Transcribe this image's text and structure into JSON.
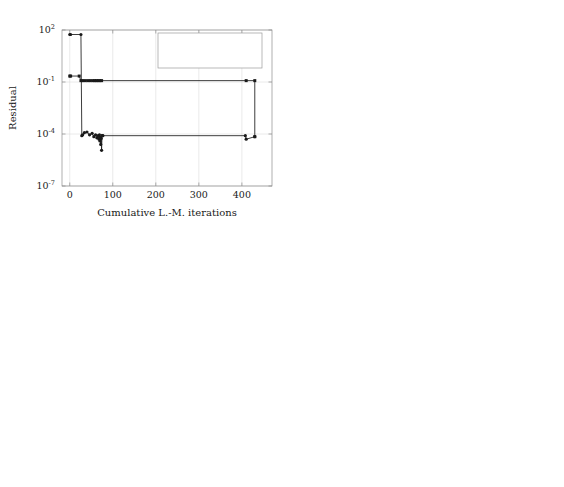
{
  "figure": {
    "layout": "2x2 grid of semilog-y convergence plots",
    "legend": {
      "position": "top-right of first panel",
      "entries": [
        {
          "label": "Feasibility",
          "marker": "dot",
          "color": "#1a1a1a"
        },
        {
          "label": "Opt. cond.",
          "marker": "square",
          "color": "#1a1a1a"
        }
      ]
    },
    "common": {
      "xlabel": "Cumulative L.-M. iterations",
      "ylabel": "Residual",
      "ytick_labels": [
        "10",
        "10",
        "10",
        "10"
      ],
      "ytick_exponents": [
        "2",
        "-1",
        "-4",
        "-7"
      ],
      "ylim": [
        1e-07,
        100
      ],
      "grid": true
    }
  },
  "chart_data": [
    {
      "type": "line",
      "panel": "top-left",
      "title": "",
      "xlabel": "Cumulative L.-M. iterations",
      "ylabel": "Residual",
      "yscale": "log",
      "ylim": [
        1e-07,
        100
      ],
      "xlim": [
        -18,
        470
      ],
      "xticks": [
        0,
        100,
        200,
        300,
        400
      ],
      "xtick_labels": [
        "0",
        "100",
        "200",
        "300",
        "400"
      ],
      "yticks": [
        100,
        0.1,
        0.0001,
        1e-07
      ],
      "series": [
        {
          "name": "Feasibility",
          "x": [
            0,
            2,
            26,
            28,
            30,
            34,
            40,
            46,
            52,
            56,
            60,
            63,
            66,
            68,
            69,
            70,
            71,
            72,
            73,
            74,
            75,
            76,
            77,
            408,
            410,
            430
          ],
          "y": [
            55,
            55,
            55,
            8e-05,
            9e-05,
            0.00012,
            0.00013,
            9e-05,
            0.00011,
            7e-05,
            9e-05,
            6e-05,
            8e-05,
            5e-05,
            9e-05,
            4e-05,
            6.5e-05,
            2.5e-05,
            5.5e-05,
            1.15e-05,
            8e-05,
            8e-05,
            8e-05,
            8e-05,
            5e-05,
            7e-05
          ]
        },
        {
          "name": "Opt. cond.",
          "x": [
            0,
            2,
            22,
            26,
            30,
            36,
            42,
            48,
            54,
            58,
            62,
            66,
            70,
            74,
            410,
            430,
            430
          ],
          "y": [
            0.22,
            0.22,
            0.22,
            0.12,
            0.12,
            0.12,
            0.12,
            0.12,
            0.12,
            0.12,
            0.12,
            0.12,
            0.12,
            0.12,
            0.12,
            0.12,
            7e-05
          ]
        }
      ]
    },
    {
      "type": "line",
      "panel": "top-right",
      "title": "",
      "xlabel": "Cumulative L.-M. iterations",
      "ylabel": "Residual",
      "yscale": "log",
      "ylim": [
        1e-07,
        100
      ],
      "xlim": [
        -14,
        372
      ],
      "xticks": [
        0,
        100,
        200,
        300
      ],
      "xtick_labels": [
        "0",
        "100",
        "200",
        "300"
      ],
      "yticks": [
        100,
        0.1,
        0.0001,
        1e-07
      ],
      "series": [
        {
          "name": "Feasibility",
          "x": [
            0,
            2,
            30,
            32,
            38,
            44,
            56,
            70,
            85,
            100,
            122,
            146,
            170,
            196,
            215,
            232,
            250,
            262,
            274,
            286,
            296,
            306,
            316,
            324,
            330,
            336,
            340,
            341
          ],
          "y": [
            50,
            50,
            50,
            6e-05,
            0.00011,
            0.00011,
            0.0001,
            0.0001,
            0.0001,
            0.0001,
            0.0001,
            0.0001,
            0.0001,
            0.0001,
            9e-05,
            9e-05,
            9e-05,
            9e-05,
            9e-05,
            9e-05,
            8e-05,
            9e-05,
            0.0001,
            0.0001,
            0.0001,
            0.00011,
            0.00011,
            8e-05
          ]
        },
        {
          "name": "Opt. cond.",
          "x": [
            0,
            2,
            28,
            32,
            40,
            52,
            66,
            80,
            94,
            100,
            146,
            150,
            196,
            200,
            222,
            226,
            248,
            252,
            268,
            272,
            288,
            292,
            300,
            306,
            316,
            320,
            328,
            332,
            338,
            341
          ],
          "y": [
            0.8,
            0.8,
            0.8,
            0.65,
            0.65,
            0.65,
            0.65,
            0.65,
            0.65,
            0.65,
            0.5,
            0.5,
            0.09,
            0.09,
            0.06,
            0.06,
            0.035,
            0.035,
            0.016,
            0.016,
            0.007,
            0.007,
            0.007,
            0.0028,
            0.0028,
            0.0009,
            0.0009,
            0.00035,
            0.00012,
            0.00012
          ]
        }
      ]
    },
    {
      "type": "line",
      "panel": "bottom-left",
      "title": "",
      "xlabel": "Cumulative L.-M. iterations",
      "ylabel": "Residual",
      "yscale": "log",
      "ylim": [
        1e-07,
        100
      ],
      "xlim": [
        -32,
        880
      ],
      "xticks": [
        0,
        200,
        400,
        600,
        800
      ],
      "xtick_labels": [
        "0",
        "200",
        "400",
        "600",
        "800"
      ],
      "yticks": [
        100,
        0.1,
        0.0001,
        1e-07
      ],
      "series": [
        {
          "name": "Feasibility",
          "x": [
            0,
            3,
            20,
            24,
            30,
            40,
            50,
            58,
            63,
            66,
            68,
            70,
            71,
            72,
            73,
            74,
            75,
            76,
            78,
            80,
            82,
            84,
            460,
            800,
            800
          ],
          "y": [
            50,
            50,
            50,
            0.0001,
            0.0001,
            0.0001,
            0.0001,
            0.0001,
            9e-05,
            6e-05,
            5e-05,
            3.5e-05,
            2e-05,
            1.3e-05,
            7.5e-06,
            4.2e-06,
            2.3e-06,
            3.2e-06,
            5.5e-06,
            3.5e-06,
            1.6e-06,
            2.2e-06,
            9e-05,
            0.0001,
            4.5e-06
          ]
        },
        {
          "name": "Opt. cond.",
          "x": [
            0,
            3,
            16,
            22,
            28,
            36,
            44,
            52,
            60,
            66,
            72,
            78,
            84,
            460,
            800,
            800
          ],
          "y": [
            0.18,
            0.18,
            0.18,
            0.075,
            0.075,
            0.075,
            0.075,
            0.075,
            0.075,
            0.075,
            0.075,
            0.075,
            0.075,
            0.075,
            0.075,
            0.0001
          ]
        }
      ]
    },
    {
      "type": "line",
      "panel": "bottom-right",
      "title": "",
      "xlabel": "Cumulative L.-M. iterations",
      "ylabel": "Residual",
      "yscale": "log",
      "ylim": [
        1e-07,
        100
      ],
      "xlim": [
        -70,
        1920
      ],
      "xticks": [
        0,
        500,
        1000,
        1500
      ],
      "xtick_labels": [
        "0",
        "500",
        "1000",
        "1500"
      ],
      "yticks": [
        100,
        0.1,
        0.0001,
        1e-07
      ],
      "series": [
        {
          "name": "Feasibility",
          "x": [
            0,
            5,
            25,
            30,
            45,
            70,
            100,
            140,
            190,
            250,
            330,
            420,
            530,
            670,
            830,
            1000,
            1140,
            1270,
            1400,
            1520,
            1640,
            1700,
            1750,
            1755
          ],
          "y": [
            50,
            50,
            50,
            6e-05,
            8e-05,
            9e-05,
            0.0001,
            0.0001,
            0.0001,
            0.0001,
            0.0001,
            0.0001,
            0.0001,
            0.0001,
            0.0001,
            0.0001,
            0.0001,
            0.0001,
            0.0001,
            0.0001,
            0.0001,
            0.0001,
            0.0001,
            1.6e-05
          ]
        },
        {
          "name": "Opt. cond.",
          "x": [
            0,
            5,
            22,
            40,
            70,
            110,
            150,
            190,
            230,
            240,
            300,
            380,
            390,
            520,
            530,
            670,
            680,
            1000,
            1010,
            1270,
            1280,
            1500,
            1510,
            1650,
            1660,
            1750,
            1755
          ],
          "y": [
            0.38,
            0.38,
            0.38,
            0.55,
            0.55,
            0.55,
            0.5,
            0.5,
            0.5,
            0.08,
            0.08,
            0.08,
            0.065,
            0.065,
            0.045,
            0.045,
            0.04,
            0.04,
            0.011,
            0.011,
            0.0022,
            0.0022,
            0.0011,
            0.0011,
            0.0001,
            0.0001,
            0.0001
          ]
        }
      ]
    }
  ]
}
